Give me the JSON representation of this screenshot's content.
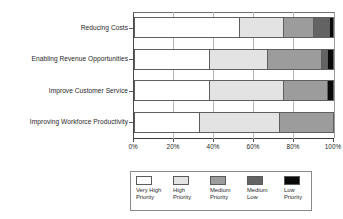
{
  "chart_data": {
    "type": "bar",
    "orientation": "horizontal",
    "stacked": true,
    "normalized": true,
    "title": "",
    "subtitle": "",
    "xlabel": "",
    "ylabel": "",
    "xlim": [
      0,
      100
    ],
    "xtick_labels": [
      "0%",
      "20%",
      "40%",
      "60%",
      "80%",
      "100%"
    ],
    "xticks": [
      0,
      20,
      40,
      60,
      80,
      100
    ],
    "grid": true,
    "legend_position": "bottom",
    "categories": [
      "Reducing Costs",
      "Enabling Revenue Opportunities",
      "Improve Customer Service",
      "Improving Workforce Productivity"
    ],
    "series": [
      {
        "name": "Very High Priority",
        "color": "#ffffff",
        "values": [
          53,
          38,
          38,
          33
        ]
      },
      {
        "name": "High Priority",
        "color": "#e3e3e3",
        "values": [
          22,
          29,
          37,
          40
        ]
      },
      {
        "name": "Medium Priority",
        "color": "#9c9c9c",
        "values": [
          15,
          27,
          22,
          27
        ]
      },
      {
        "name": "Medium Low",
        "color": "#636363",
        "values": [
          8,
          3,
          0,
          0
        ]
      },
      {
        "name": "Low Priority",
        "color": "#0a0a0a",
        "values": [
          2,
          3,
          3,
          0
        ]
      }
    ]
  },
  "legend": {
    "entries": [
      {
        "label": "Very High\nPriority",
        "color": "#ffffff"
      },
      {
        "label": "High\nPriority",
        "color": "#e3e3e3"
      },
      {
        "label": "Medium\nPriority",
        "color": "#9c9c9c"
      },
      {
        "label": "Medium\nLow",
        "color": "#636363"
      },
      {
        "label": "Low\nPriority",
        "color": "#0a0a0a"
      }
    ]
  }
}
